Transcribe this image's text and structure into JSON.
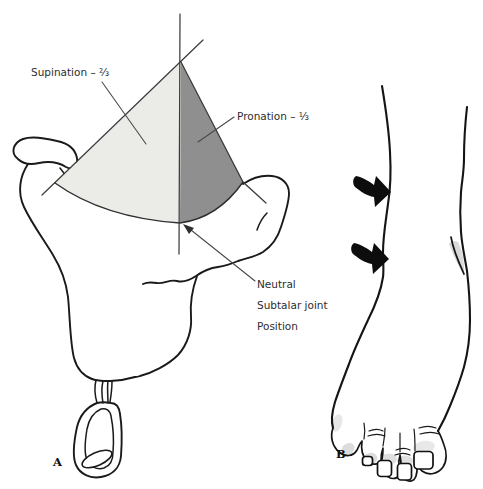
{
  "panel_a": {
    "label": "A",
    "supination_label": "Supination – ⅔",
    "pronation_label": "Pronation – ⅓",
    "neutral_label": {
      "line1": "Neutral",
      "line2": "Subtalar joint",
      "line3": "Position"
    },
    "colors": {
      "supination_fill": "#ebebe8",
      "pronation_fill": "#8f8f8f",
      "outline": "#1a1a1a"
    }
  },
  "panel_b": {
    "label": "B",
    "colors": {
      "arrow": "#0d0d0d",
      "shading": "#b9b9b9"
    }
  }
}
